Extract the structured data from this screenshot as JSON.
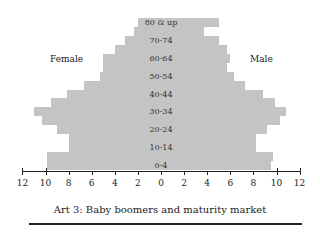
{
  "chart_data": {
    "type": "bar",
    "orientation": "horizontal",
    "subtype": "population-pyramid",
    "title": "Art 3: Baby boomers and maturity market",
    "xlabel": "",
    "ylabel": "",
    "xlim": [
      -12,
      12
    ],
    "x_ticks": [
      12,
      10,
      8,
      6,
      4,
      2,
      0,
      2,
      4,
      6,
      8,
      10,
      12
    ],
    "categories": [
      "0-4",
      "5-9",
      "10-14",
      "15-19",
      "20-24",
      "25-29",
      "30-34",
      "35-39",
      "40-44",
      "45-49",
      "50-54",
      "55-59",
      "60-64",
      "65-69",
      "70-74",
      "75-79",
      "80 & up"
    ],
    "category_labels_shown": [
      "0-4",
      "10-14",
      "20-24",
      "30-34",
      "40-44",
      "50-54",
      "60-64",
      "70-74",
      "80 & up"
    ],
    "series": [
      {
        "name": "Female",
        "side": "left",
        "values": [
          9.9,
          9.9,
          8.0,
          8.0,
          9.0,
          10.3,
          11.0,
          9.5,
          8.1,
          6.7,
          5.3,
          5.0,
          5.0,
          4.0,
          3.1,
          2.3,
          2.0
        ]
      },
      {
        "name": "Male",
        "side": "right",
        "values": [
          9.5,
          9.7,
          8.2,
          8.2,
          9.2,
          10.3,
          10.8,
          9.9,
          8.8,
          7.3,
          6.3,
          5.7,
          6.0,
          5.7,
          5.0,
          3.7,
          5.0
        ]
      }
    ],
    "legend": [
      "Female",
      "Male"
    ],
    "grid": false,
    "bar_color": "#c4c4c4"
  },
  "labels": {
    "female": "Female",
    "male": "Male",
    "title": "Art 3: Baby boomers and maturity market"
  }
}
